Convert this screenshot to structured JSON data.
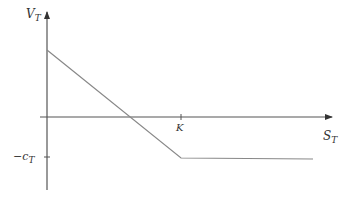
{
  "diagram": {
    "type": "payoff-diagram",
    "y_axis_label": "V",
    "y_axis_sub": "T",
    "x_axis_label": "S",
    "x_axis_sub": "T",
    "strike_label": "K",
    "premium_label": "−c",
    "premium_sub": "T",
    "colors": {
      "axis": "#333333",
      "line": "#777777"
    }
  }
}
